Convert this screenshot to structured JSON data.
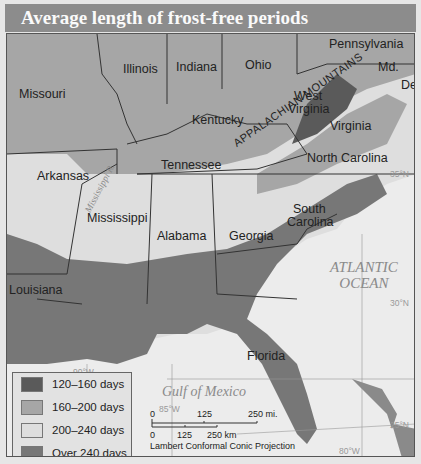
{
  "title": "Average length of frost-free periods",
  "states": [
    {
      "name": "Missouri"
    },
    {
      "name": "Illinois"
    },
    {
      "name": "Indiana"
    },
    {
      "name": "Ohio"
    },
    {
      "name": "Pennsylvania"
    },
    {
      "name": "Md."
    },
    {
      "name": "Del."
    },
    {
      "name": "West"
    },
    {
      "name": "Virginia"
    },
    {
      "name": "Kentucky"
    },
    {
      "name": "Virginia"
    },
    {
      "name": "Tennessee"
    },
    {
      "name": "North Carolina"
    },
    {
      "name": "Arkansas"
    },
    {
      "name": "Mississippi"
    },
    {
      "name": "Alabama"
    },
    {
      "name": "Georgia"
    },
    {
      "name": "South"
    },
    {
      "name": "Carolina"
    },
    {
      "name": "Louisiana"
    },
    {
      "name": "Florida"
    }
  ],
  "features": {
    "mountains": "APPALACHIAN MOUNTAINS",
    "river": "Mississippi R.",
    "atlantic_line1": "ATLANTIC",
    "atlantic_line2": "OCEAN",
    "gulf": "Gulf of Mexico"
  },
  "gridlines": {
    "lat35": "35°N",
    "lat30": "30°N",
    "lat25": "25°N",
    "lon90": "90°W",
    "lon85": "85°W",
    "lon80": "80°W"
  },
  "legend": {
    "items": [
      {
        "label": "120–160 days",
        "color": "#5a5a5a"
      },
      {
        "label": "160–200 days",
        "color": "#a6a6a6"
      },
      {
        "label": "200–240 days",
        "color": "#dedede"
      },
      {
        "label": "Over 240 days",
        "color": "#777777"
      }
    ]
  },
  "scale_bar": {
    "mi_zero": "0",
    "mi_mid": "125",
    "mi_end": "250 mi.",
    "km_zero": "0",
    "km_mid": "125",
    "km_end": "250 km",
    "projection": "Lambert Conformal Conic Projection"
  }
}
